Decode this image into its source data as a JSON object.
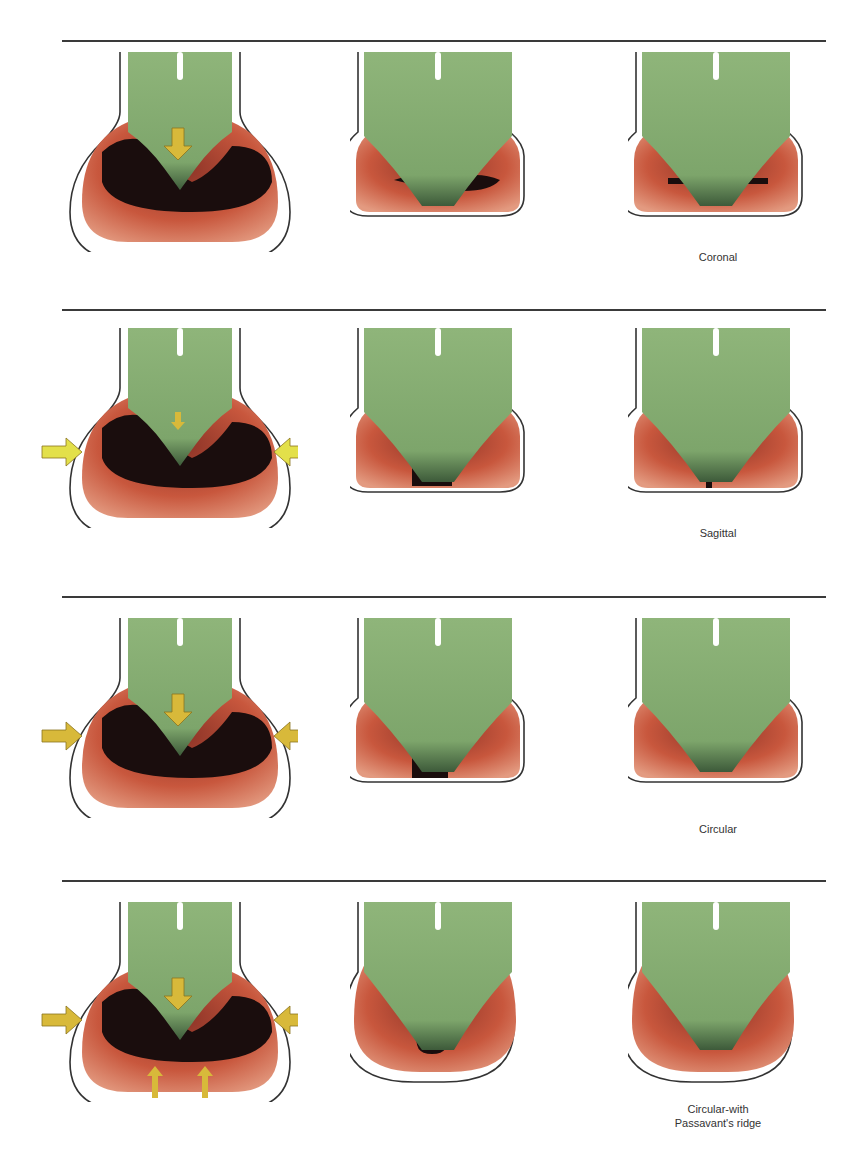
{
  "figure": {
    "rows": [
      {
        "id": "coronal",
        "label": "Coronal",
        "rule_y": 40,
        "panel_top": 52,
        "label_y": 250,
        "stages": [
          "open",
          "partial",
          "closed"
        ],
        "arrows": [
          "down"
        ]
      },
      {
        "id": "sagittal",
        "label": "Sagittal",
        "rule_y": 310,
        "panel_top": 328,
        "label_y": 526,
        "stages": [
          "open",
          "partial",
          "closed"
        ],
        "arrows": [
          "down-small",
          "left",
          "right"
        ]
      },
      {
        "id": "circular",
        "label": "Circular",
        "rule_y": 596,
        "panel_top": 618,
        "label_y": 822,
        "stages": [
          "open",
          "partial",
          "closed"
        ],
        "arrows": [
          "down",
          "left",
          "right"
        ]
      },
      {
        "id": "circular-passavant",
        "label": "Circular-with\nPassavant's ridge",
        "label_line1": "Circular-with",
        "label_line2": "Passavant's ridge",
        "rule_y": 880,
        "panel_top": 902,
        "label_y": 1104,
        "stages": [
          "open",
          "partial",
          "closed"
        ],
        "arrows": [
          "down",
          "left",
          "right",
          "up",
          "up"
        ]
      }
    ]
  },
  "colors": {
    "velum_green": "#8fb57a",
    "velum_dark": "#3d5a3a",
    "pharynx_red": "#c8573d",
    "pharynx_light": "#e39a80",
    "airway_dark": "#1a0d0d",
    "arrow_yellow": "#d8b93a",
    "outline": "#333333"
  }
}
